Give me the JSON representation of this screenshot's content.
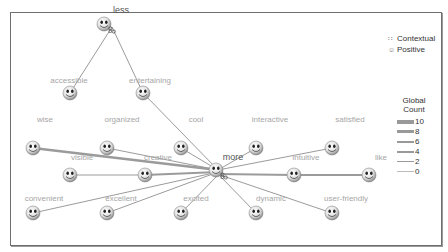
{
  "nodes": {
    "less": "less",
    "accessible": "accessible",
    "entertaining": "entertaining",
    "wise": "wise",
    "organized": "organized",
    "cool": "cool",
    "interactive": "interactive",
    "satisfied": "satisfied",
    "visible": "visible",
    "creative": "creative",
    "more": "more",
    "intuitive": "intuitive",
    "like": "like",
    "convenient": "convenient",
    "excellent": "excellent",
    "excited": "excited",
    "dynamic": "dynamic",
    "user_friendly": "user-friendly"
  },
  "legend": {
    "types": [
      {
        "icon": "contextual-icon",
        "label": "Contextual"
      },
      {
        "icon": "positive-icon",
        "label": "Positive"
      }
    ],
    "count_title_1": "Global",
    "count_title_2": "Count",
    "counts": [
      {
        "label": "10",
        "width": 3.5
      },
      {
        "label": "8",
        "width": 3
      },
      {
        "label": "6",
        "width": 2
      },
      {
        "label": "4",
        "width": 1.6
      },
      {
        "label": "2",
        "width": 1.2
      },
      {
        "label": "0",
        "width": 0.8
      }
    ]
  },
  "colors": {
    "edge": "#9b9b9b",
    "label": "#a6a6a6",
    "frame": "#6f6f6f"
  }
}
